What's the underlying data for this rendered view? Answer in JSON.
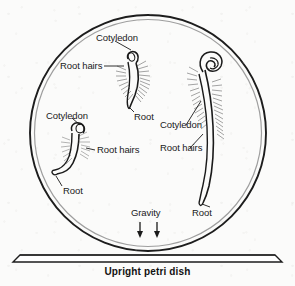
{
  "figure": {
    "title": "Upright petri dish",
    "dish": {
      "shape": "circle",
      "outer_ring_color": "#1d1d1d",
      "inner_ring_color": "#9a9a9a",
      "center_x": 148,
      "center_y": 133,
      "radius": 118
    },
    "base": {
      "name": "platform-slab",
      "color": "#1d1d1d"
    },
    "gravity": {
      "label": "Gravity",
      "arrow_count": 2,
      "direction": "down"
    },
    "seedlings": [
      {
        "id": "top-seedling",
        "labels": {
          "cotyledon": "Cotyledon",
          "root_hairs": "Root hairs",
          "root": "Root"
        }
      },
      {
        "id": "left-seedling",
        "labels": {
          "cotyledon": "Cotyledon",
          "root_hairs": "Root hairs",
          "root": "Root"
        }
      },
      {
        "id": "right-seedling",
        "labels": {
          "cotyledon": "Cotyledon",
          "root_hairs": "Root hairs",
          "root": "Root"
        }
      }
    ],
    "ink_color": "#1a1a1a"
  }
}
